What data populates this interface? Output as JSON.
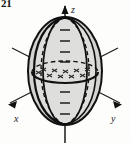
{
  "figure": {
    "number": "21",
    "type": "3d-ellipsoid-diagram",
    "caption": ""
  },
  "colors": {
    "background": "#fdfdfb",
    "stroke": "#1a1a1a",
    "surface_fill": "#c9c9c7",
    "surface_fill_light": "#dcdcda",
    "hatch": "#2b2b2b"
  },
  "axes": [
    {
      "name": "x-axis",
      "label": "x",
      "direction": "lower-left",
      "arrow": true
    },
    {
      "name": "y-axis",
      "label": "y",
      "direction": "lower-right",
      "arrow": true
    },
    {
      "name": "z-axis",
      "label": "z",
      "direction": "up",
      "arrow": true
    }
  ],
  "ticks": {
    "z_axis_count": 8,
    "style": "cross-hatch"
  },
  "solid": {
    "name": "ellipsoid",
    "equator": "ellipse",
    "meridians": 2,
    "hidden_lines": "dashed",
    "cross_section_hatched": true
  },
  "labels": {
    "x": "x",
    "y": "y",
    "z": "z"
  }
}
